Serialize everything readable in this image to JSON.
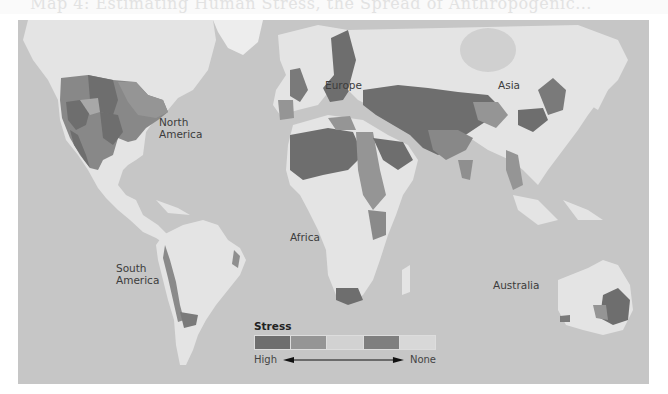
{
  "heading_fragment": "Map 4: Estimating Human Stress, the Spread of Anthropogenic...",
  "map": {
    "ocean_color": "#c6c6c6",
    "land_color": "#e4e4e4",
    "continent_labels": [
      {
        "name": "North America",
        "lines": [
          "North",
          "America"
        ]
      },
      {
        "name": "Europe",
        "lines": [
          "Europe"
        ]
      },
      {
        "name": "Asia",
        "lines": [
          "Asia"
        ]
      },
      {
        "name": "Africa",
        "lines": [
          "Africa"
        ]
      },
      {
        "name": "South America",
        "lines": [
          "South",
          "America"
        ]
      },
      {
        "name": "Australia",
        "lines": [
          "Australia"
        ]
      }
    ]
  },
  "legend": {
    "title": "Stress",
    "levels": [
      {
        "rank": 1,
        "color": "#6e6e6e"
      },
      {
        "rank": 2,
        "color": "#959595"
      },
      {
        "rank": 3,
        "color": "#d2d2d2"
      },
      {
        "rank": 4,
        "color": "#7f7f7f"
      },
      {
        "rank": 5,
        "color": "#d8d8d8"
      }
    ],
    "low_label": "High",
    "high_label": "None",
    "arrow": "double-headed-arrow"
  }
}
